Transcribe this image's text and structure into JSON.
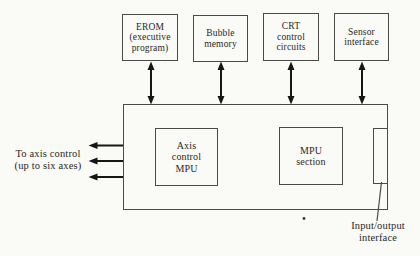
{
  "diagram": {
    "top_boxes": [
      {
        "name": "erom",
        "lines": [
          "EROM",
          "(executive",
          "program)"
        ]
      },
      {
        "name": "bubble",
        "lines": [
          "Bubble",
          "memory"
        ]
      },
      {
        "name": "crt",
        "lines": [
          "CRT",
          "control",
          "circuits"
        ]
      },
      {
        "name": "sensor",
        "lines": [
          "Sensor",
          "interface"
        ]
      }
    ],
    "inner_boxes": [
      {
        "name": "axis-mpu",
        "lines": [
          "Axis",
          "control",
          "MPU"
        ]
      },
      {
        "name": "mpu-section",
        "lines": [
          "MPU",
          "section"
        ]
      }
    ],
    "left_label": {
      "lines": [
        "To axis control",
        "(up to six axes)"
      ]
    },
    "io_label": {
      "lines": [
        "Input/output",
        "interface"
      ]
    },
    "colors": {
      "background": "#fafaf7",
      "line": "#4a4a46",
      "arrow": "#161616",
      "text": "#2b2724"
    }
  }
}
